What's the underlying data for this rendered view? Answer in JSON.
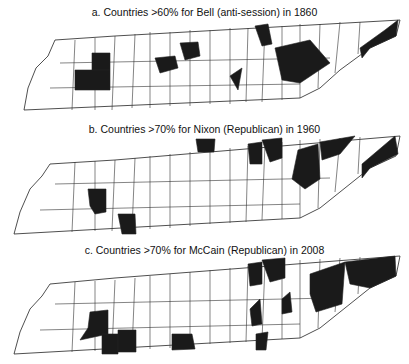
{
  "figure": {
    "panels": [
      {
        "id": "a",
        "title": "a. Countries >60% for Bell (anti-session) in 1860"
      },
      {
        "id": "b",
        "title": "b. Countries >70% for Nixon (Republican) in 1960"
      },
      {
        "id": "c",
        "title": "c. Countries >70% for McCain (Republican) in 2008"
      }
    ],
    "colors": {
      "shaded": "#1a1a1a",
      "unshaded": "#ffffff",
      "border": "#222222"
    }
  }
}
